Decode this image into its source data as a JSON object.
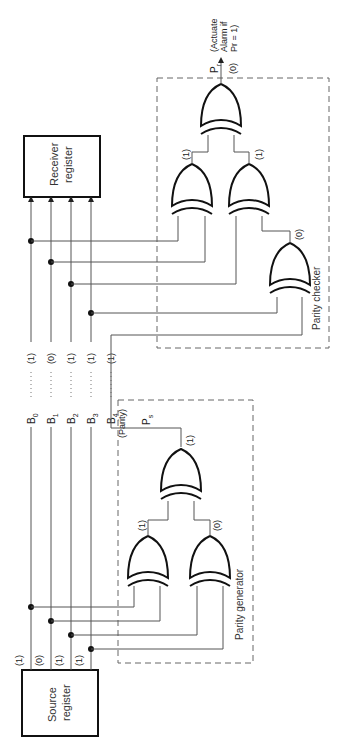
{
  "diagram": {
    "registers": {
      "source": {
        "line1": "Source",
        "line2": "register"
      },
      "receiver": {
        "line1": "Receiver",
        "line2": "register"
      }
    },
    "sections": {
      "generator_label": "Parity generator",
      "checker_label": "Parity checker"
    },
    "bits": [
      {
        "name": "B",
        "sub": "0",
        "source_value": "(1)",
        "line_value": "(1)"
      },
      {
        "name": "B",
        "sub": "1",
        "source_value": "(0)",
        "line_value": "(0)"
      },
      {
        "name": "B",
        "sub": "2",
        "source_value": "(1)",
        "line_value": "(1)"
      },
      {
        "name": "B",
        "sub": "3",
        "source_value": "(1)",
        "line_value": "(1)"
      },
      {
        "name": "B",
        "sub": "4",
        "line_value": "(1)"
      }
    ],
    "parity_line_label": "(Parity)",
    "generator": {
      "gate_outputs": {
        "left": "(1)",
        "right": "(0)",
        "top": "(1)"
      },
      "output_name": "P",
      "output_sub": "s"
    },
    "checker": {
      "gate_outputs": {
        "left": "(1)",
        "right": "(1)",
        "third": "(0)"
      },
      "output_name": "P",
      "output_sub": "r",
      "output_value": "(0)",
      "note_line1": "(Actuate",
      "note_line2": "Alarm if",
      "note_line3": "Pr = 1)"
    },
    "colors": {
      "line": "#555555",
      "ink": "#111111",
      "background": "#ffffff"
    }
  }
}
